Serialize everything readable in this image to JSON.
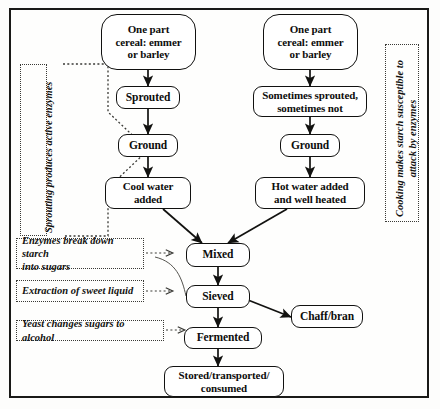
{
  "diagram": {
    "frame_color": "#1a1a18",
    "node_border_color": "#111110",
    "annotation_color": "#3a3a36"
  },
  "nodes": {
    "left_cereal": {
      "label": "One part\ncereal: emmer\nor barley"
    },
    "right_cereal": {
      "label": "One part\ncereal: emmer\nor barley"
    },
    "sprouted": {
      "label": "Sprouted"
    },
    "sometimes": {
      "label": "Sometimes sprouted,\nsometimes not"
    },
    "ground_left": {
      "label": "Ground"
    },
    "ground_right": {
      "label": "Ground"
    },
    "cool_water": {
      "label": "Cool water\nadded"
    },
    "hot_water": {
      "label": "Hot water added\nand well heated"
    },
    "mixed": {
      "label": "Mixed"
    },
    "sieved": {
      "label": "Sieved"
    },
    "chaff": {
      "label": "Chaff/bran"
    },
    "fermented": {
      "label": "Fermented"
    },
    "stored": {
      "label": "Stored/transported/\nconsumed"
    }
  },
  "annotations": {
    "sprouting": {
      "label": "Sprouting produces active enzymes"
    },
    "cooking": {
      "label": "Cooking makes starch susceptible to\nattack by enzymes"
    },
    "enzymes": {
      "label": "Enzymes break down starch\ninto sugars"
    },
    "extraction": {
      "label": "Extraction of sweet liquid"
    },
    "yeast": {
      "label": "Yeast changes sugars to alcohol"
    }
  }
}
